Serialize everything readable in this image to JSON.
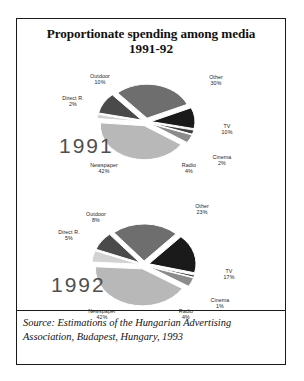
{
  "figure": {
    "title_line1": "Proportionate spending among media",
    "title_line2": "1991-92",
    "source_line1": "Source: Estimations of the Hungarian Advertising",
    "source_line2": "Association, Budapest, Hungary, 1993"
  },
  "chart_data": [
    {
      "type": "pie",
      "title": "1991",
      "year_label": "1991",
      "exploded": true,
      "units": "percent",
      "categories": [
        "Other",
        "TV",
        "Cinema",
        "Radio",
        "Newspaper",
        "Direct R.",
        "Outdoor"
      ],
      "values": [
        30,
        10,
        2,
        4,
        42,
        2,
        10
      ],
      "labels": [
        {
          "name": "Other",
          "pct": "30%",
          "value": 30,
          "color": "#6e6e6e"
        },
        {
          "name": "TV",
          "pct": "10%",
          "value": 10,
          "color": "#1a1a1a"
        },
        {
          "name": "Cinema",
          "pct": "2%",
          "value": 2,
          "color": "#3f3f3f"
        },
        {
          "name": "Radio",
          "pct": "4%",
          "value": 4,
          "color": "#8c8c8c"
        },
        {
          "name": "Newspaper",
          "pct": "42%",
          "value": 42,
          "color": "#b8b8b8"
        },
        {
          "name": "Direct R.",
          "pct": "2%",
          "value": 2,
          "color": "#d2d2d2"
        },
        {
          "name": "Outdoor",
          "pct": "10%",
          "value": 10,
          "color": "#4a4a4a"
        }
      ],
      "legend_position": "none",
      "grid": false
    },
    {
      "type": "pie",
      "title": "1992",
      "year_label": "1992",
      "exploded": true,
      "units": "percent",
      "categories": [
        "Other",
        "TV",
        "Cinema",
        "Radio",
        "Newspaper",
        "Direct R.",
        "Outdoor"
      ],
      "values": [
        23,
        17,
        1,
        4,
        42,
        5,
        8
      ],
      "labels": [
        {
          "name": "Other",
          "pct": "23%",
          "value": 23,
          "color": "#6e6e6e"
        },
        {
          "name": "TV",
          "pct": "17%",
          "value": 17,
          "color": "#1a1a1a"
        },
        {
          "name": "Cinema",
          "pct": "1%",
          "value": 1,
          "color": "#3f3f3f"
        },
        {
          "name": "Radio",
          "pct": "4%",
          "value": 4,
          "color": "#8c8c8c"
        },
        {
          "name": "Newspaper",
          "pct": "42%",
          "value": 42,
          "color": "#b8b8b8"
        },
        {
          "name": "Direct R.",
          "pct": "5%",
          "value": 5,
          "color": "#d2d2d2"
        },
        {
          "name": "Outdoor",
          "pct": "8%",
          "value": 8,
          "color": "#4a4a4a"
        }
      ],
      "legend_position": "none",
      "grid": false
    }
  ]
}
